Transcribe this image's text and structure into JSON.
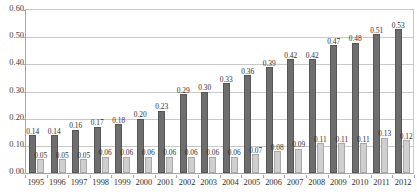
{
  "chart_data": {
    "type": "bar",
    "title": "",
    "subtitle": "",
    "xlabel": "",
    "ylabel": "",
    "ylim": [
      0.0,
      0.6
    ],
    "ytick_labels": [
      "0.60",
      "0.50",
      "0.40",
      "0.30",
      "0.20",
      "0.10",
      "0.00"
    ],
    "ytick_values": [
      0.6,
      0.5,
      0.4,
      0.3,
      0.2,
      0.1,
      0.0
    ],
    "grid": true,
    "legend": "none",
    "categories": [
      "1995",
      "1996",
      "1997",
      "1998",
      "1999",
      "2000",
      "2001",
      "2002",
      "2003",
      "2004",
      "2005",
      "2006",
      "2007",
      "2008",
      "2009",
      "2010",
      "2011",
      "2012"
    ],
    "series": [
      {
        "name": "series-dark",
        "color": "#6e6e6e",
        "values": [
          0.14,
          0.14,
          0.16,
          0.17,
          0.18,
          0.2,
          0.23,
          0.29,
          0.3,
          0.33,
          0.36,
          0.39,
          0.42,
          0.42,
          0.47,
          0.48,
          0.51,
          0.53
        ],
        "labels": [
          "0.14",
          "0.14",
          "0.16",
          "0.17",
          "0.18",
          "0.20",
          "0.23",
          "0.29",
          "0.30",
          "0.33",
          "0.36",
          "0.39",
          "0.42",
          "0.42",
          "0.47",
          "0.48",
          "0.51",
          "0.53"
        ]
      },
      {
        "name": "series-light",
        "color": "#cfcfcf",
        "values": [
          0.05,
          0.05,
          0.05,
          0.06,
          0.06,
          0.06,
          0.06,
          0.06,
          0.06,
          0.06,
          0.07,
          0.08,
          0.09,
          0.11,
          0.11,
          0.11,
          0.13,
          0.12
        ],
        "labels": [
          "0.05",
          "0.05",
          "0.05",
          "0.06",
          "0.06",
          "0.06",
          "0.06",
          "0.06",
          "0.06",
          "0.06",
          "0.07",
          "0.08",
          "0.09",
          "0.11",
          "0.11",
          "0.11",
          "0.13",
          "0.12"
        ]
      }
    ]
  }
}
